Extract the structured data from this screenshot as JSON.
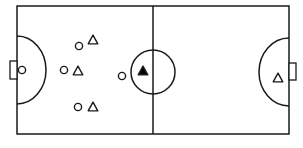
{
  "diagram": {
    "type": "futsal-court-formation",
    "colors": {
      "line": "#1a1a1a",
      "background": "#ffffff",
      "ball_holder_fill": "#000000"
    },
    "court": {
      "x": 17,
      "y": 6,
      "width": 272,
      "height": 128
    },
    "center_line_x": 153,
    "center_circle": {
      "cx": 153,
      "cy": 72,
      "r": 22
    },
    "left_goal": {
      "x": 10,
      "y": 61,
      "w": 7,
      "h": 18
    },
    "right_goal": {
      "x": 289,
      "y": 63,
      "w": 7,
      "h": 17
    },
    "left_area": {
      "cx": 17,
      "cy": 70,
      "rx": 29,
      "ry": 34
    },
    "right_area": {
      "cx": 289,
      "cy": 72,
      "rx": 30,
      "ry": 34
    },
    "team_circles": [
      {
        "role": "goalkeeper",
        "x": 22,
        "y": 70
      },
      {
        "role": "defender-top",
        "x": 79,
        "y": 46
      },
      {
        "role": "defender-middle",
        "x": 64,
        "y": 70
      },
      {
        "role": "defender-bottom",
        "x": 78,
        "y": 107
      },
      {
        "role": "forward",
        "x": 122,
        "y": 76
      }
    ],
    "team_triangles": [
      {
        "role": "attacker-top",
        "x": 93,
        "y": 40,
        "filled": false
      },
      {
        "role": "attacker-middle",
        "x": 78,
        "y": 71,
        "filled": false
      },
      {
        "role": "attacker-bottom",
        "x": 93,
        "y": 107,
        "filled": false
      },
      {
        "role": "ball-holder",
        "x": 143,
        "y": 71,
        "filled": true
      },
      {
        "role": "goalkeeper",
        "x": 278,
        "y": 78,
        "filled": false
      }
    ]
  }
}
